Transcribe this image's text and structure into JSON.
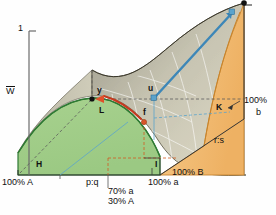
{
  "figure": {
    "kind": "3d-surface-phase-diagram",
    "background": "#ffffff"
  },
  "axes": {
    "vertical": {
      "label": "W",
      "label_overbar": true,
      "top_tick_label": "1",
      "tick_present": true,
      "color": "#555555"
    },
    "right_vertical": {
      "top_tick_label": "1",
      "clipped": true,
      "color": "#333333"
    },
    "front_left_base": {
      "label": "100% A"
    },
    "front_right_base": {
      "label": "100% a"
    },
    "right_depth_base": {
      "label": "100% B"
    },
    "right_side_top": {
      "label": "100%",
      "label2": "b"
    }
  },
  "labels": [
    {
      "id": "axis-top-1",
      "text": "1",
      "x": 18,
      "y": 27,
      "cls": "t1"
    },
    {
      "id": "axis-W",
      "text": "W",
      "x": 6,
      "y": 89,
      "cls": "t1"
    },
    {
      "id": "point-y",
      "text": "y",
      "x": 97,
      "y": 89,
      "cls": "t3"
    },
    {
      "id": "point-L",
      "text": "L",
      "x": 99,
      "y": 110,
      "cls": "t3"
    },
    {
      "id": "point-u",
      "text": "u",
      "x": 148,
      "y": 88,
      "cls": "t3"
    },
    {
      "id": "point-f",
      "text": "f",
      "x": 142,
      "y": 110,
      "cls": "t3"
    },
    {
      "id": "region-H",
      "text": "H",
      "x": 36,
      "y": 167,
      "cls": "t3"
    },
    {
      "id": "region-K",
      "text": "K",
      "x": 219,
      "y": 108,
      "cls": "t3"
    },
    {
      "id": "corner-I",
      "text": "I",
      "x": 154,
      "y": 167,
      "cls": "t3"
    },
    {
      "id": "ratio-rs",
      "text": "r:s",
      "x": 216,
      "y": 142,
      "cls": "t1"
    },
    {
      "id": "ratio-pq",
      "text": "p:q",
      "x": 88,
      "y": 182,
      "cls": "t1"
    },
    {
      "id": "base-100A",
      "text": "100% A",
      "x": 3,
      "y": 181,
      "cls": "t1"
    },
    {
      "id": "base-100a",
      "text": "100% a",
      "x": 148,
      "y": 181,
      "cls": "t1"
    },
    {
      "id": "base-100B",
      "text": "100% B",
      "x": 172,
      "y": 171,
      "cls": "t1"
    },
    {
      "id": "mix-70a",
      "text": "70% a",
      "x": 110,
      "y": 190,
      "cls": "t1"
    },
    {
      "id": "mix-30A",
      "text": "30% A",
      "x": 110,
      "y": 200,
      "cls": "t1"
    },
    {
      "id": "side-100pct",
      "text": "100%",
      "x": 246,
      "y": 100,
      "cls": "t1"
    },
    {
      "id": "side-b",
      "text": "b",
      "x": 256,
      "y": 112,
      "cls": "t1"
    }
  ],
  "colors": {
    "green_region": "#9ccb86",
    "green_region_edge": "#2f7a34",
    "orange_region": "#f1b96a",
    "orange_region_edge": "#c87a22",
    "surface_top": "#b7b4a4",
    "surface_mid": "#c9c6b4",
    "surface_light": "#ddd9c6",
    "blue_arrow": "#3d87b8",
    "red_arrow": "#c43a1e",
    "black_point": "#111111",
    "dashed_grey": "#555555",
    "grid_white": "#ffffff",
    "axis_grey": "#666666"
  },
  "markers": [
    {
      "id": "marker-y",
      "shape": "dot",
      "color": "#111111",
      "x": 92,
      "y": 99
    },
    {
      "id": "marker-f",
      "shape": "dot",
      "color": "#d8552a",
      "x": 144,
      "y": 122
    },
    {
      "id": "marker-u",
      "shape": "square",
      "color": "#4a93c4",
      "x": 154,
      "y": 98
    },
    {
      "id": "marker-E",
      "shape": "dot",
      "color": "#111111",
      "x": 244,
      "y": 3
    },
    {
      "id": "marker-arrowhead-blue",
      "shape": "square",
      "color": "#4a93c4",
      "x": 234,
      "y": 11
    }
  ],
  "arrows": [
    {
      "id": "arrow-red-yf",
      "from": "y",
      "to": "f",
      "color": "#c43a1e",
      "style": "curved"
    },
    {
      "id": "arrow-blue-uE",
      "from": "u",
      "to": "E",
      "color": "#3d87b8",
      "style": "straight"
    }
  ]
}
